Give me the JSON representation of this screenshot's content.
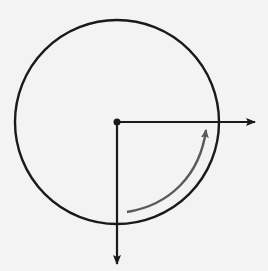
{
  "diagram": {
    "colors": {
      "background": "#f3f3f3",
      "stroke": "#1a1a1a",
      "rotation_arrow": "#5a5a5a"
    },
    "circle": {
      "cx": 117,
      "cy": 122,
      "r": 102
    },
    "center_point": {
      "x": 117,
      "y": 122
    },
    "axes": [
      {
        "name": "x-axis-arrow",
        "direction": "right",
        "from": [
          117,
          122
        ],
        "to": [
          256,
          122
        ]
      },
      {
        "name": "y-axis-arrow",
        "direction": "down",
        "from": [
          117,
          122
        ],
        "to": [
          117,
          265
        ]
      }
    ],
    "rotation_arrow": {
      "direction": "counterclockwise",
      "from": "down",
      "to": "right"
    }
  }
}
